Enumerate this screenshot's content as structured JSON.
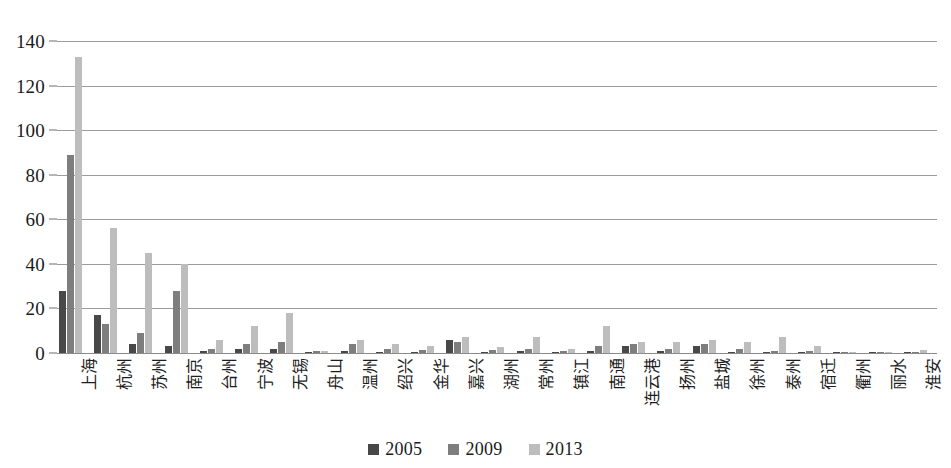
{
  "chart_data": {
    "type": "bar",
    "title": "",
    "subtitle": "",
    "xlabel": "",
    "ylabel": "",
    "ylim": [
      0,
      140
    ],
    "ytick_step": 20,
    "yticks": [
      "0",
      "20",
      "40",
      "60",
      "80",
      "100",
      "120",
      "140"
    ],
    "grid": true,
    "grid_axis": "y",
    "legend_position": "bottom-center",
    "categories": [
      "上海",
      "杭州",
      "苏州",
      "南京",
      "台州",
      "宁波",
      "无锡",
      "舟山",
      "温州",
      "绍兴",
      "金华",
      "嘉兴",
      "湖州",
      "常州",
      "镇江",
      "南通",
      "连云港",
      "扬州",
      "盐城",
      "徐州",
      "泰州",
      "宿迁",
      "衢州",
      "丽水",
      "淮安"
    ],
    "series": [
      {
        "name": "2005",
        "color": "#484848",
        "values": [
          28,
          17,
          4,
          3,
          1,
          2,
          2,
          0.4,
          1,
          0.6,
          0.5,
          6,
          0.5,
          1,
          0.4,
          1,
          3,
          1,
          3,
          0.6,
          0.4,
          0.3,
          0.2,
          0.2,
          0.2
        ]
      },
      {
        "name": "2009",
        "color": "#7e7e7e",
        "values": [
          89,
          13,
          9,
          28,
          2,
          4,
          5,
          0.7,
          4,
          2,
          1.5,
          5,
          1.5,
          2,
          1,
          3,
          4,
          2,
          4,
          2,
          1,
          1,
          0.4,
          0.3,
          0.3
        ]
      },
      {
        "name": "2013",
        "color": "#bdbdbd",
        "values": [
          133,
          56,
          45,
          40,
          6,
          12,
          18,
          1,
          6,
          4,
          3,
          7,
          2.5,
          7,
          2,
          12,
          5,
          5,
          6,
          5,
          7,
          3,
          0.6,
          0.5,
          1.5
        ]
      }
    ]
  },
  "legend": {
    "items": [
      {
        "label": "2005",
        "color": "#484848"
      },
      {
        "label": "2009",
        "color": "#7e7e7e"
      },
      {
        "label": "2013",
        "color": "#bdbdbd"
      }
    ]
  }
}
